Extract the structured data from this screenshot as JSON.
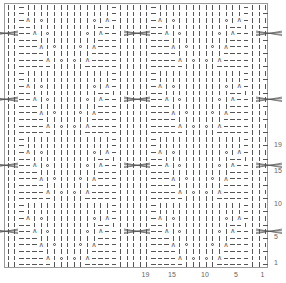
{
  "chart": {
    "title": "",
    "columns": 40,
    "rows": 40,
    "repeat_width": 20,
    "repeat_height": 10,
    "legend": {
      "|": "knit",
      "-": "purl",
      "O": "yarn over",
      "⋏": "decrease (k3tog / sl1-k2tog-psso)",
      "X": "cable cross"
    },
    "repeat_rows_bottom_up": [
      "||-----|||||-----|||",
      "||----⋏|O|O|⋏----|||",
      "||----|||||||----|||",
      "||---⋏|O|||O|⋏---|||",
      "||---|||||||||---|||",
      "||--⋏|O|||||O|⋏--|||",
      "||--||||||||||--||||",
      "||-⋏|O|||||||O|⋏-|||",
      "||-|||||||||||||-|||",
      "||-|||||||||||||-|||"
    ],
    "cable_rows_in_repeat": [
      6
    ],
    "selvedge": "-",
    "row_labels": [
      {
        "label": "1",
        "row": 1
      },
      {
        "label": "5",
        "row": 5
      },
      {
        "label": "10",
        "row": 10
      },
      {
        "label": "15",
        "row": 15
      },
      {
        "label": "19",
        "row": 19
      }
    ],
    "col_labels": [
      {
        "label": "19",
        "col": 19
      },
      {
        "label": "15",
        "col": 15
      },
      {
        "label": "10",
        "col": 10
      },
      {
        "label": "5",
        "col": 5
      },
      {
        "label": "1",
        "col": 1
      }
    ],
    "colors": {
      "grid_border": "#9a9a9a",
      "symbol": "#555555",
      "label": "#666666"
    }
  }
}
